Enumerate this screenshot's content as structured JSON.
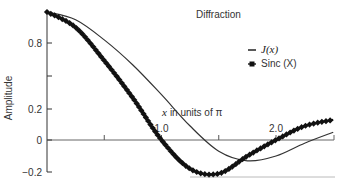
{
  "chart_data": {
    "type": "line",
    "title": "Diffraction",
    "xlabel": "x in units of π",
    "ylabel": "Amplitude",
    "xlim": [
      0,
      2.5
    ],
    "ylim": [
      -0.2,
      1.0
    ],
    "x_ticks": [
      {
        "value": 0.5,
        "label": ""
      },
      {
        "value": 1.0,
        "label": "1.0"
      },
      {
        "value": 1.5,
        "label": ""
      },
      {
        "value": 2.0,
        "label": "2.0"
      }
    ],
    "y_ticks": [
      {
        "value": 0.8,
        "label": "0.8"
      },
      {
        "value": 0.5,
        "label": ""
      },
      {
        "value": 0.2,
        "label": "0.2"
      },
      {
        "value": 0.0,
        "label": "0"
      },
      {
        "value": -0.2,
        "label": "-0.2"
      }
    ],
    "legend": [
      {
        "name": "J(x)",
        "marker": "line"
      },
      {
        "name": "Sinc (X)",
        "marker": "square"
      }
    ],
    "legend_position": "right-middle",
    "grid": false,
    "series": [
      {
        "name": "J(x)",
        "style": "thin line",
        "x": [
          0,
          0.25,
          0.5,
          0.75,
          1.0,
          1.25,
          1.5,
          1.75,
          2.0,
          2.25,
          2.5
        ],
        "values": [
          1.0,
          0.95,
          0.82,
          0.6,
          0.33,
          0.09,
          -0.07,
          -0.13,
          -0.1,
          -0.02,
          0.05
        ]
      },
      {
        "name": "Sinc (X)",
        "style": "line with square markers",
        "x": [
          0,
          0.25,
          0.5,
          0.75,
          1.0,
          1.25,
          1.5,
          1.75,
          2.0,
          2.25,
          2.5
        ],
        "values": [
          1.0,
          0.9,
          0.64,
          0.3,
          0.0,
          -0.18,
          -0.21,
          -0.1,
          0.0,
          0.09,
          0.13
        ]
      }
    ]
  }
}
